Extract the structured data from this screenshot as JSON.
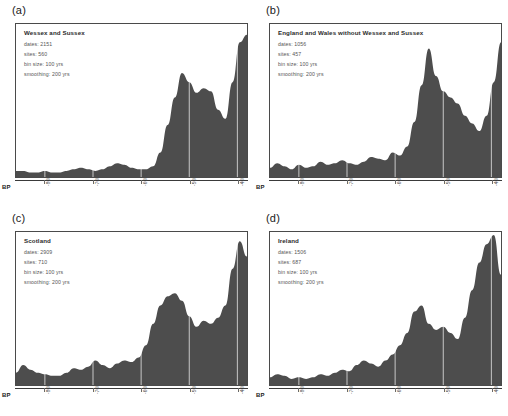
{
  "figure": {
    "axis_label": "BP",
    "fill_color": "#4d4d4d",
    "grid_color": "#ffffff",
    "border_color": "#4a4a4a"
  },
  "chart_data": [
    {
      "type": "area",
      "panel": "a",
      "panel_letter": "(a)",
      "title": "Wessex and Sussex",
      "dates_label": "dates: 2151",
      "sites_label": "sites: 560",
      "bin_label": "bin size: 100 yrs",
      "smoothing_label": "smoothing: 200 yrs",
      "dates": 2151,
      "sites": 560,
      "bin_size_yrs": 100,
      "smoothing_yrs": 200,
      "xlabel": "BP",
      "ylabel": "",
      "grid": true,
      "legend": "none",
      "xlim": [
        -8600,
        -3800
      ],
      "ylim": [
        0,
        100
      ],
      "tick_labels": [
        "-8000",
        "-7000",
        "-6000",
        "-5000",
        "-4000"
      ],
      "tick_values": [
        -8000,
        -7000,
        -6000,
        -5000,
        -4000
      ],
      "x": [
        -8600,
        -8450,
        -8300,
        -8150,
        -8000,
        -7850,
        -7700,
        -7550,
        -7400,
        -7250,
        -7100,
        -6950,
        -6800,
        -6650,
        -6500,
        -6350,
        -6200,
        -6050,
        -5900,
        -5750,
        -5600,
        -5450,
        -5300,
        -5150,
        -5000,
        -4850,
        -4700,
        -4550,
        -4400,
        -4250,
        -4100,
        -3950,
        -3800
      ],
      "values": [
        4,
        4,
        3,
        3,
        4,
        3,
        3,
        4,
        5,
        6,
        5,
        4,
        5,
        7,
        9,
        8,
        6,
        5,
        5,
        7,
        16,
        34,
        52,
        68,
        62,
        55,
        58,
        56,
        44,
        38,
        62,
        88,
        93,
        70
      ]
    },
    {
      "type": "area",
      "panel": "b",
      "panel_letter": "(b)",
      "title": "England and Wales without Wessex and Sussex",
      "dates_label": "dates: 1056",
      "sites_label": "sites: 457",
      "bin_label": "bin size: 100 yrs",
      "smoothing_label": "smoothing: 200 yrs",
      "dates": 1056,
      "sites": 457,
      "bin_size_yrs": 100,
      "smoothing_yrs": 200,
      "xlabel": "BP",
      "ylabel": "",
      "grid": true,
      "legend": "none",
      "xlim": [
        -8600,
        -3800
      ],
      "ylim": [
        0,
        100
      ],
      "tick_labels": [
        "-8000",
        "-7000",
        "-6000",
        "-5000",
        "-4000"
      ],
      "tick_values": [
        -8000,
        -7000,
        -6000,
        -5000,
        -4000
      ],
      "x": [
        -8600,
        -8450,
        -8300,
        -8150,
        -8000,
        -7850,
        -7700,
        -7550,
        -7400,
        -7250,
        -7100,
        -6950,
        -6800,
        -6650,
        -6500,
        -6350,
        -6200,
        -6050,
        -5900,
        -5750,
        -5600,
        -5450,
        -5300,
        -5150,
        -5000,
        -4850,
        -4700,
        -4550,
        -4400,
        -4250,
        -4100,
        -3950,
        -3800
      ],
      "values": [
        6,
        9,
        7,
        5,
        8,
        6,
        7,
        10,
        8,
        9,
        11,
        9,
        8,
        10,
        13,
        12,
        11,
        16,
        14,
        20,
        36,
        60,
        84,
        66,
        56,
        52,
        48,
        40,
        35,
        30,
        40,
        62,
        88,
        95
      ]
    },
    {
      "type": "area",
      "panel": "c",
      "panel_letter": "(c)",
      "title": "Scotland",
      "dates_label": "dates: 2909",
      "sites_label": "sites: 710",
      "bin_label": "bin size: 100 yrs",
      "smoothing_label": "smoothing: 200 yrs",
      "dates": 2909,
      "sites": 710,
      "bin_size_yrs": 100,
      "smoothing_yrs": 200,
      "xlabel": "BP",
      "ylabel": "",
      "grid": true,
      "legend": "none",
      "xlim": [
        -8600,
        -3800
      ],
      "ylim": [
        0,
        100
      ],
      "tick_labels": [
        "-8000",
        "-7000",
        "-6000",
        "-5000",
        "-4000"
      ],
      "tick_values": [
        -8000,
        -7000,
        -6000,
        -5000,
        -4000
      ],
      "x": [
        -8600,
        -8450,
        -8300,
        -8150,
        -8000,
        -7850,
        -7700,
        -7550,
        -7400,
        -7250,
        -7100,
        -6950,
        -6800,
        -6650,
        -6500,
        -6350,
        -6200,
        -6050,
        -5900,
        -5750,
        -5600,
        -5450,
        -5300,
        -5150,
        -5000,
        -4850,
        -4700,
        -4550,
        -4400,
        -4250,
        -4100,
        -3950,
        -3800
      ],
      "values": [
        8,
        13,
        10,
        8,
        7,
        6,
        6,
        8,
        11,
        10,
        12,
        16,
        13,
        11,
        14,
        16,
        15,
        18,
        26,
        40,
        52,
        58,
        60,
        55,
        45,
        38,
        42,
        40,
        44,
        52,
        76,
        94,
        84,
        62
      ]
    },
    {
      "type": "area",
      "panel": "d",
      "panel_letter": "(d)",
      "title": "Ireland",
      "dates_label": "dates: 1506",
      "sites_label": "sites: 687",
      "bin_label": "bin size: 100 yrs",
      "smoothing_label": "smoothing: 200 yrs",
      "dates": 1506,
      "sites": 687,
      "bin_size_yrs": 100,
      "smoothing_yrs": 200,
      "xlabel": "BP",
      "ylabel": "",
      "grid": true,
      "legend": "none",
      "xlim": [
        -8600,
        -3800
      ],
      "ylim": [
        0,
        100
      ],
      "tick_labels": [
        "-8000",
        "-7000",
        "-6000",
        "-5000",
        "-4000"
      ],
      "tick_values": [
        -8000,
        -7000,
        -6000,
        -5000,
        -4000
      ],
      "x": [
        -8600,
        -8450,
        -8300,
        -8150,
        -8000,
        -7850,
        -7700,
        -7550,
        -7400,
        -7250,
        -7100,
        -6950,
        -6800,
        -6650,
        -6500,
        -6350,
        -6200,
        -6050,
        -5900,
        -5750,
        -5600,
        -5450,
        -5300,
        -5150,
        -5000,
        -4850,
        -4700,
        -4550,
        -4400,
        -4250,
        -4100,
        -3950,
        -3800
      ],
      "values": [
        5,
        7,
        6,
        4,
        5,
        4,
        5,
        7,
        6,
        8,
        10,
        9,
        13,
        16,
        14,
        12,
        16,
        20,
        26,
        34,
        48,
        52,
        40,
        36,
        38,
        34,
        30,
        44,
        62,
        80,
        92,
        98,
        72
      ]
    }
  ]
}
